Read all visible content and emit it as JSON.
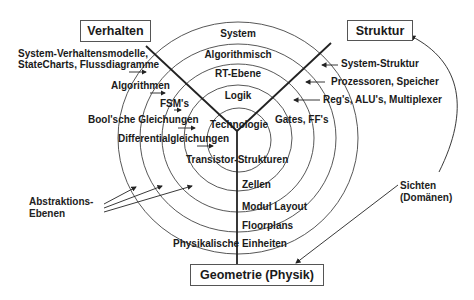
{
  "domains": {
    "behavior": "Verhalten",
    "structure": "Struktur",
    "geometry": "Geometrie (Physik)"
  },
  "abstraction_levels": [
    {
      "label": "System"
    },
    {
      "label": "Algorithmisch"
    },
    {
      "label": "RT-Ebene"
    },
    {
      "label": "Logik"
    },
    {
      "label": "Technologie"
    }
  ],
  "behavior_items": {
    "system_line1": "System-Verhaltensmodelle,",
    "system_line2": "StateCharts, Flussdiagramme",
    "algorithmic": "Algorithmen",
    "rt": "FSM's",
    "logic": "Bool'sche Gleichungen",
    "technology": "Differentialgleichungen"
  },
  "structure_items": {
    "system": "System-Struktur",
    "algorithmic": "Prozessoren, Speicher",
    "rt": "Reg's, ALU's, Multiplexer",
    "logic": "Gates, FF's"
  },
  "geometry_items": {
    "technology": "Transistor-Strukturen",
    "logic": "Zellen",
    "rt": "Modul Layout",
    "algorithmic": "Floorplans",
    "system": "Physikalische Einheiten"
  },
  "annotations": {
    "abstraction_line1": "Abstraktions-",
    "abstraction_line2": "Ebenen",
    "views_line1": "Sichten",
    "views_line2": "(Domänen)"
  },
  "colors": {
    "line": "#222222",
    "circle": "#444444",
    "box_border": "#555555"
  }
}
